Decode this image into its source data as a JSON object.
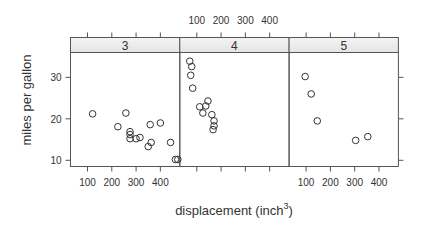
{
  "chart_data": {
    "type": "scatter",
    "title": "",
    "xlabel": "displacement (inch³)",
    "xlabel_base": "displacement (inch",
    "xlabel_sup": "3",
    "xlabel_close": ")",
    "ylabel": "miles per gallon",
    "xlim": [
      30,
      480
    ],
    "ylim": [
      8.5,
      36
    ],
    "x_ticks": [
      100,
      200,
      300,
      400
    ],
    "y_ticks": [
      10,
      20,
      30
    ],
    "grid": false,
    "legend": null,
    "layout": "lattice 3 panels in 1 row, conditioned on gear",
    "panels": [
      {
        "strip": "3",
        "points": [
          {
            "x": 121,
            "y": 21.2
          },
          {
            "x": 258,
            "y": 21.4
          },
          {
            "x": 225,
            "y": 18.1
          },
          {
            "x": 275,
            "y": 16.9
          },
          {
            "x": 275,
            "y": 16.2
          },
          {
            "x": 275,
            "y": 15.2
          },
          {
            "x": 300,
            "y": 15.2
          },
          {
            "x": 316,
            "y": 15.5
          },
          {
            "x": 358,
            "y": 18.6
          },
          {
            "x": 400,
            "y": 19.0
          },
          {
            "x": 362,
            "y": 14.3
          },
          {
            "x": 350,
            "y": 13.3
          },
          {
            "x": 442,
            "y": 14.3
          },
          {
            "x": 462,
            "y": 10.2
          },
          {
            "x": 472,
            "y": 10.2
          }
        ]
      },
      {
        "strip": "4",
        "points": [
          {
            "x": 71,
            "y": 33.9
          },
          {
            "x": 79,
            "y": 32.6
          },
          {
            "x": 75,
            "y": 30.5
          },
          {
            "x": 83,
            "y": 27.4
          },
          {
            "x": 146,
            "y": 24.3
          },
          {
            "x": 112,
            "y": 22.9
          },
          {
            "x": 137,
            "y": 23.1
          },
          {
            "x": 125,
            "y": 21.4
          },
          {
            "x": 162,
            "y": 21.0
          },
          {
            "x": 171,
            "y": 19.5
          },
          {
            "x": 171,
            "y": 18.3
          },
          {
            "x": 167,
            "y": 17.4
          }
        ]
      },
      {
        "strip": "5",
        "points": [
          {
            "x": 96,
            "y": 30.2
          },
          {
            "x": 121,
            "y": 26.0
          },
          {
            "x": 146,
            "y": 19.5
          },
          {
            "x": 304,
            "y": 14.8
          },
          {
            "x": 354,
            "y": 15.7
          }
        ]
      }
    ],
    "colors": {
      "strip_fill": "#ebebeb",
      "frame": "#555555",
      "point": "#333333",
      "text": "#333333"
    }
  }
}
